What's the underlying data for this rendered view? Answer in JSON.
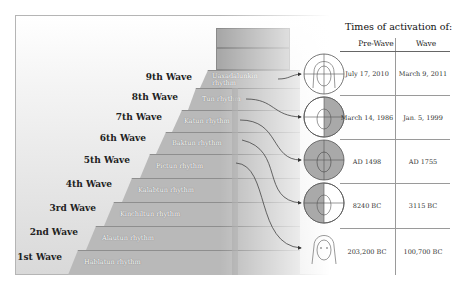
{
  "table": {
    "title": "Times of activation of:",
    "columns": [
      "Pre-Wave",
      "Wave"
    ],
    "rows": [
      {
        "wave": "9th Wave",
        "pre_wave": "July 17, 2010",
        "wave_date": "March 9, 2011",
        "face": "face-crosshair-unshaded"
      },
      {
        "wave": "8th Wave",
        "pre_wave": "March 14, 1986",
        "wave_date": "Jan. 5, 1999",
        "face": "face-crosshair-right-half-shaded"
      },
      {
        "wave": "6th Wave",
        "pre_wave": "AD 1498",
        "wave_date": "AD 1755",
        "face": "face-crosshair-fully-shaded"
      },
      {
        "wave": "5th Wave",
        "pre_wave": "8240 BC",
        "wave_date": "3115 BC",
        "face": "face-crosshair-left-half-shaded"
      },
      {
        "wave": "1st Wave",
        "pre_wave": "203,200 BC",
        "wave_date": "100,700 BC",
        "face": "face-plain"
      }
    ]
  },
  "pyramid": {
    "steps": [
      {
        "wave": "9th Wave",
        "rhythm": "Uaxadalunkin rhythm"
      },
      {
        "wave": "8th Wave",
        "rhythm": "Tun rhythm"
      },
      {
        "wave": "7th Wave",
        "rhythm": "Katun rhythm"
      },
      {
        "wave": "6th Wave",
        "rhythm": "Baktun rhythm"
      },
      {
        "wave": "5th Wave",
        "rhythm": "Pictun rhythm"
      },
      {
        "wave": "4th Wave",
        "rhythm": "Kalabtun rhythm"
      },
      {
        "wave": "3rd Wave",
        "rhythm": "Kinchiltun rhythm"
      },
      {
        "wave": "2nd Wave",
        "rhythm": "Alautun rhythm"
      },
      {
        "wave": "1st Wave",
        "rhythm": "Hablatun rhythm"
      }
    ]
  },
  "colors": {
    "step": "#b9b9b9",
    "shade": "#a9a9a9",
    "line": "#9a9a9a"
  }
}
